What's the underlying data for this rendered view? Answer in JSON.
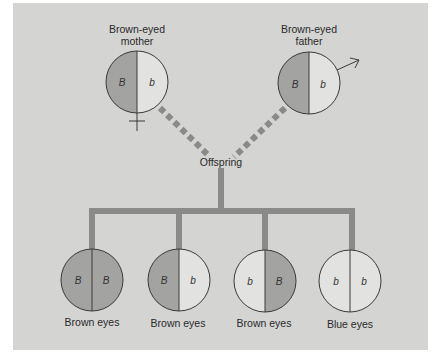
{
  "colors": {
    "background": "#d4d4d2",
    "dominant_fill": "#a3a3a1",
    "recessive_fill": "#e2e2e0",
    "line": "#3a3a3a",
    "connector": "#8a8a88"
  },
  "parents": {
    "mother": {
      "label_line1": "Brown-eyed",
      "label_line2": "mother",
      "alleles": [
        "B",
        "b"
      ],
      "symbol": "female-symbol"
    },
    "father": {
      "label_line1": "Brown-eyed",
      "label_line2": "father",
      "alleles": [
        "B",
        "b"
      ],
      "symbol": "male-symbol"
    }
  },
  "offspring_label": "Offspring",
  "offspring": [
    {
      "alleles": [
        "B",
        "B"
      ],
      "phenotype": "Brown eyes"
    },
    {
      "alleles": [
        "B",
        "b"
      ],
      "phenotype": "Brown eyes"
    },
    {
      "alleles": [
        "b",
        "B"
      ],
      "phenotype": "Brown eyes"
    },
    {
      "alleles": [
        "b",
        "b"
      ],
      "phenotype": "Blue eyes"
    }
  ]
}
